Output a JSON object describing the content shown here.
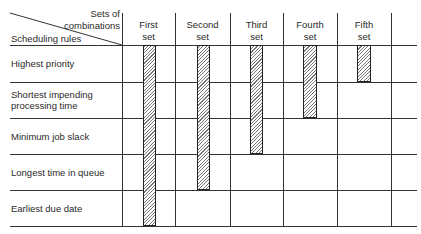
{
  "header": {
    "corner_top_label": "Sets of\ncombinations",
    "corner_bottom_label": "Scheduling rules",
    "columns": [
      {
        "label": "First\nset"
      },
      {
        "label": "Second\nset"
      },
      {
        "label": "Third\nset"
      },
      {
        "label": "Fourth\nset"
      },
      {
        "label": "Fifth\nset"
      }
    ]
  },
  "rows": [
    {
      "label": "Highest priority"
    },
    {
      "label": "Shortest impending\nprocessing time"
    },
    {
      "label": "Minimum job slack"
    },
    {
      "label": "Longest time in queue"
    },
    {
      "label": "Earliest due date"
    }
  ],
  "matrix": {
    "description": "Hatched bar indicates rule included in set",
    "sets": [
      {
        "set": "First set",
        "rules": [
          "Highest priority",
          "Shortest impending processing time",
          "Minimum job slack",
          "Longest time in queue",
          "Earliest due date"
        ]
      },
      {
        "set": "Second set",
        "rules": [
          "Highest priority",
          "Shortest impending processing time",
          "Minimum job slack",
          "Longest time in queue"
        ]
      },
      {
        "set": "Third set",
        "rules": [
          "Highest priority",
          "Shortest impending processing time",
          "Minimum job slack"
        ]
      },
      {
        "set": "Fourth set",
        "rules": [
          "Highest priority",
          "Shortest impending processing time"
        ]
      },
      {
        "set": "Fifth set",
        "rules": [
          "Highest priority"
        ]
      }
    ]
  },
  "colors": {
    "line": "#333333",
    "bar_border": "#222222",
    "hatch": "#777777",
    "background": "#ffffff"
  }
}
